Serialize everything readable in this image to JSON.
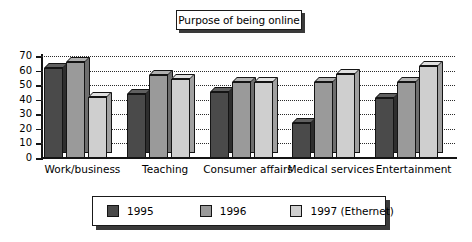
{
  "chart_data": {
    "type": "bar",
    "title": "Purpose of being online",
    "xlabel": "",
    "ylabel": "",
    "ylim": [
      0,
      70
    ],
    "yticks": [
      0,
      10,
      20,
      30,
      40,
      50,
      60,
      70
    ],
    "grid": true,
    "legend_position": "bottom",
    "categories": [
      "Work/business",
      "Teaching",
      "Consumer affairs",
      "Medical services",
      "Entertainment"
    ],
    "series": [
      {
        "name": "1995",
        "color": "#4a4a4a",
        "values": [
          62,
          44,
          45,
          24,
          41
        ]
      },
      {
        "name": "1996",
        "color": "#9a9a9a",
        "values": [
          66,
          57,
          52,
          52,
          52
        ]
      },
      {
        "name": "1997 (Ethernet)",
        "color": "#cfcfcf",
        "values": [
          42,
          54,
          52,
          58,
          63
        ]
      }
    ]
  }
}
